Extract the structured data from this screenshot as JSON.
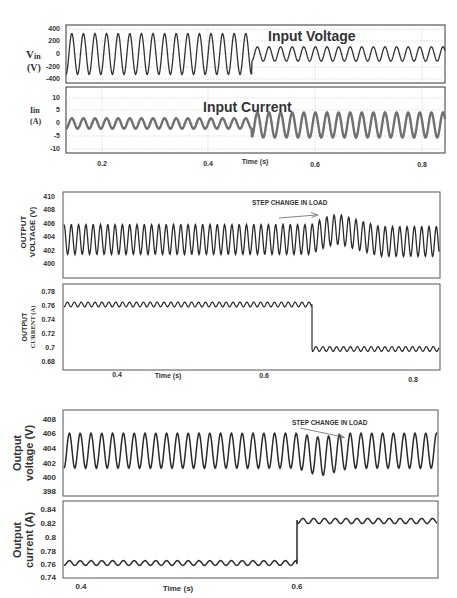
{
  "chart_data": [
    {
      "type": "line",
      "panel": "fig1-top",
      "title": "Input Voltage",
      "ylabel": "Vin (V)",
      "xlabel": "Time (s)",
      "yticks": [
        "400",
        "200",
        "0",
        "-200",
        "-400"
      ],
      "ylim": [
        -400,
        400
      ],
      "xticks": [
        "0.2",
        "0.4",
        "0.6",
        "0.8"
      ],
      "grid": true,
      "series": [
        {
          "name": "Vin",
          "segments": [
            {
              "t_start": 0.13,
              "t_end": 0.48,
              "amplitude": 325,
              "offset": 0
            },
            {
              "t_start": 0.48,
              "t_end": 0.83,
              "amplitude": 110,
              "offset": 0
            }
          ]
        }
      ]
    },
    {
      "type": "line",
      "panel": "fig1-bottom",
      "title": "Input Current",
      "ylabel": "Iin (A)",
      "xlabel": "Time (s)",
      "yticks": [
        "10",
        "5",
        "0",
        "-5",
        "-10"
      ],
      "ylim": [
        -10,
        10
      ],
      "xticks": [
        "0.2",
        "0.4",
        "0.6",
        "0.8"
      ],
      "grid": true,
      "series": [
        {
          "name": "Iin",
          "segments": [
            {
              "t_start": 0.13,
              "t_end": 0.48,
              "amplitude": 2,
              "offset": 0
            },
            {
              "t_start": 0.48,
              "t_end": 0.83,
              "amplitude": 5,
              "offset": -1
            }
          ]
        }
      ]
    },
    {
      "type": "line",
      "panel": "fig2-top",
      "ylabel": "OUTPUT VOLTAGE (V)",
      "yticks": [
        "410",
        "408",
        "406",
        "404",
        "402",
        "400"
      ],
      "ylim": [
        399,
        411
      ],
      "xticks": [
        "0.4",
        "0.6",
        "0.8"
      ],
      "annotation": "STEP CHANGE IN LOAD",
      "series": [
        {
          "name": "Vout",
          "segments": [
            {
              "t_start": 0.33,
              "t_end": 0.665,
              "mean": 403.5,
              "ripple_pp": 4.5
            },
            {
              "t_start": 0.665,
              "t_end": 0.72,
              "mean": 405,
              "ripple_pp": 4.5,
              "note": "overshoot peak ~407.3"
            },
            {
              "t_start": 0.72,
              "t_end": 0.83,
              "mean": 403.2,
              "ripple_pp": 4.5
            }
          ]
        }
      ]
    },
    {
      "type": "line",
      "panel": "fig2-bottom",
      "ylabel": "OUTPUT CURRENT (A)",
      "xlabel": "Time (s)",
      "yticks": [
        "0.78",
        "0.76",
        "0.74",
        "0.72",
        "0.7",
        "0.68"
      ],
      "ylim": [
        0.675,
        0.785
      ],
      "xticks": [
        "0.4",
        "0.6",
        "0.8"
      ],
      "series": [
        {
          "name": "Iout",
          "segments": [
            {
              "t_start": 0.33,
              "t_end": 0.665,
              "mean": 0.758,
              "ripple_pp": 0.006
            },
            {
              "t_start": 0.665,
              "t_end": 0.83,
              "mean": 0.694,
              "ripple_pp": 0.006
            }
          ]
        }
      ]
    },
    {
      "type": "line",
      "panel": "fig3-top",
      "ylabel": "Output voltage (V)",
      "yticks": [
        "408",
        "406",
        "404",
        "402",
        "400",
        "398"
      ],
      "ylim": [
        397.5,
        409
      ],
      "xticks": [
        "0.4",
        "0.6"
      ],
      "annotation": "STEP CHANGE IN LOAD",
      "series": [
        {
          "name": "Vout",
          "segments": [
            {
              "t_start": 0.39,
              "t_end": 0.6,
              "mean": 403.6,
              "ripple_pp": 4.6
            },
            {
              "t_start": 0.6,
              "t_end": 0.66,
              "mean": 402.5,
              "ripple_pp": 5.0,
              "note": "undershoot min ~399.5"
            },
            {
              "t_start": 0.66,
              "t_end": 0.74,
              "mean": 403.7,
              "ripple_pp": 4.6
            }
          ]
        }
      ]
    },
    {
      "type": "line",
      "panel": "fig3-bottom",
      "ylabel": "Output current (A)",
      "xlabel": "Time (s)",
      "yticks": [
        "0.84",
        "0.82",
        "0.8",
        "0.78",
        "0.76",
        "0.74"
      ],
      "ylim": [
        0.735,
        0.845
      ],
      "xticks": [
        "0.4",
        "0.6"
      ],
      "series": [
        {
          "name": "Iout",
          "segments": [
            {
              "t_start": 0.39,
              "t_end": 0.6,
              "mean": 0.759,
              "ripple_pp": 0.006
            },
            {
              "t_start": 0.6,
              "t_end": 0.74,
              "mean": 0.822,
              "ripple_pp": 0.007
            }
          ]
        }
      ]
    }
  ],
  "fig1": {
    "vin_title": "Input Voltage",
    "iin_title": "Input Current",
    "vin_label_main": "V",
    "vin_label_sub": "in",
    "vin_label_unit": "(V)",
    "iin_label_main": "Iin",
    "iin_label_unit": "(A)",
    "vin_yticks": [
      "400",
      "200",
      "0",
      "-200",
      "-400"
    ],
    "iin_yticks": [
      "10",
      "5",
      "0",
      "-5",
      "-10"
    ],
    "xticks": [
      "0.2",
      "0.4",
      "0.6",
      "0.8"
    ],
    "xlabel": "Time (s)"
  },
  "fig2": {
    "v_ylabel_1": "OUTPUT",
    "v_ylabel_2": "VOLTAGE (V)",
    "i_ylabel_1": "OUTPUT",
    "i_ylabel_2": "CURRENT (A)",
    "v_yticks": [
      "410",
      "408",
      "406",
      "404",
      "402",
      "400"
    ],
    "i_yticks": [
      "0.78",
      "0.76",
      "0.74",
      "0.72",
      "0.7",
      "0.68"
    ],
    "xticks": [
      "0.4",
      "0.6",
      "0.8"
    ],
    "xlabel": "Time (s)",
    "annotation": "STEP CHANGE IN LOAD"
  },
  "fig3": {
    "v_ylabel_1": "Output",
    "v_ylabel_2": "voltage (V)",
    "i_ylabel_1": "Output",
    "i_ylabel_2": "current (A)",
    "v_yticks": [
      "408",
      "406",
      "404",
      "402",
      "400",
      "398"
    ],
    "i_yticks": [
      "0.84",
      "0.82",
      "0.8",
      "0.78",
      "0.76",
      "0.74"
    ],
    "xticks": [
      "0.4",
      "0.6"
    ],
    "xlabel": "Time (s)",
    "annotation": "STEP CHANGE IN LOAD"
  },
  "colors": {
    "trace": "#2b2b2b",
    "trace_gray": "#6e6e6e",
    "frame": "#555555",
    "grid": "#bdbdbd"
  }
}
